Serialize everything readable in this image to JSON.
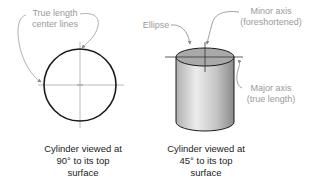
{
  "diagram": {
    "left_figure": {
      "callout": [
        "True length",
        "center lines"
      ],
      "caption": [
        "Cylinder viewed at",
        "90° to its top",
        "surface"
      ]
    },
    "right_figure": {
      "callout_ellipse": "Ellipse",
      "callout_minor": [
        "Minor axis",
        "(foreshortened)"
      ],
      "callout_major": [
        "Major axis",
        "(true length)"
      ],
      "caption": [
        "Cylinder viewed at",
        "45° to its top",
        "surface"
      ]
    },
    "colors": {
      "outline": "#1a1a1a",
      "leader": "#9a9a9a",
      "centerline": "#a0a0a0",
      "top_fill": "#a8a8a8",
      "body_light": "#e6e6e6",
      "body_dark": "#8c8c8c"
    }
  }
}
